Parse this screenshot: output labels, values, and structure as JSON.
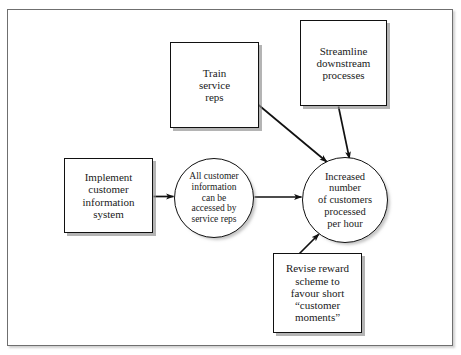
{
  "diagram": {
    "type": "causal-map",
    "title": "",
    "frame": {
      "border_color": "#6f6f6f",
      "background": "#ffffff"
    },
    "style": {
      "node_border_color": "#111111",
      "node_fill": "#ffffff",
      "text_color": "#1a1a1a",
      "shadow_color": "#8c8c8c",
      "arrow_color": "#111111"
    },
    "nodes": [
      {
        "id": "implement",
        "shape": "rectangle",
        "label": "Implement\ncustomer\ninformation\nsystem"
      },
      {
        "id": "train",
        "shape": "rectangle",
        "label": "Train\nservice\nreps"
      },
      {
        "id": "streamline",
        "shape": "rectangle",
        "label": "Streamline\ndownstream\nprocesses"
      },
      {
        "id": "revise",
        "shape": "rectangle",
        "label": "Revise reward\nscheme to\nfavour short\n“customer\nmoments”"
      },
      {
        "id": "access",
        "shape": "ellipse",
        "label": "All customer\ninformation\ncan be\naccessed by\nservice reps"
      },
      {
        "id": "increased",
        "shape": "ellipse",
        "label": "Increased\nnumber\nof customers\nprocessed\nper hour"
      }
    ],
    "edges": [
      {
        "id": "implement-to-access",
        "from": "implement",
        "to": "access",
        "style": "straight-arrow"
      },
      {
        "id": "access-to-increased",
        "from": "access",
        "to": "increased",
        "style": "straight-arrow"
      },
      {
        "id": "train-to-increased",
        "from": "train",
        "to": "increased",
        "style": "straight-arrow"
      },
      {
        "id": "streamline-to-increased",
        "from": "streamline",
        "to": "increased",
        "style": "straight-arrow"
      },
      {
        "id": "revise-to-increased",
        "from": "revise",
        "to": "increased",
        "style": "straight-arrow"
      }
    ]
  }
}
